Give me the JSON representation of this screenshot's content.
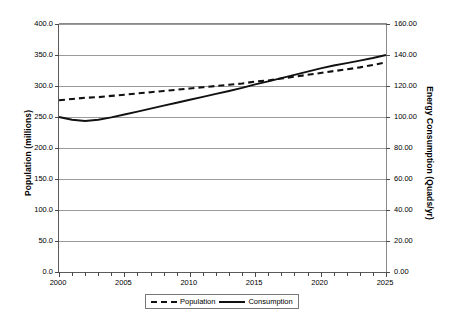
{
  "chart_data": {
    "type": "line",
    "title": "",
    "xlabel": "",
    "ylabel": "Population (millions)",
    "y2label": "Energy Consumption (Quads/yr)",
    "grid": true,
    "legend_position": "bottom",
    "xlim": [
      2000,
      2025
    ],
    "xticks": [
      "2000",
      "2005",
      "2010",
      "2015",
      "2020",
      "2025"
    ],
    "xtick_values": [
      2000,
      2005,
      2010,
      2015,
      2020,
      2025
    ],
    "x_minor_tick_step": 1,
    "ylim": [
      0,
      400
    ],
    "yticks": [
      "0.0",
      "50.0",
      "100.0",
      "150.0",
      "200.0",
      "250.0",
      "300.0",
      "350.0",
      "400.0"
    ],
    "ytick_values": [
      0,
      50,
      100,
      150,
      200,
      250,
      300,
      350,
      400
    ],
    "y2lim": [
      0,
      160
    ],
    "y2ticks": [
      "0.00",
      "20.00",
      "40.00",
      "60.00",
      "80.00",
      "100.00",
      "120.00",
      "140.00",
      "160.00"
    ],
    "y2tick_values": [
      0,
      20,
      40,
      60,
      80,
      100,
      120,
      140,
      160
    ],
    "x": [
      2000,
      2001,
      2002,
      2003,
      2004,
      2005,
      2006,
      2007,
      2008,
      2009,
      2010,
      2011,
      2012,
      2013,
      2014,
      2015,
      2016,
      2017,
      2018,
      2019,
      2020,
      2021,
      2022,
      2023,
      2024,
      2025
    ],
    "series": [
      {
        "name": "Population",
        "axis": "left",
        "style": "dashed",
        "color": "#111111",
        "values": [
          277,
          279,
          281,
          282,
          284,
          286,
          288,
          290,
          292,
          294,
          296,
          298,
          300,
          302,
          304,
          307,
          309,
          312,
          315,
          318,
          321,
          324,
          327,
          330,
          334,
          338
        ]
      },
      {
        "name": "Consumption",
        "axis": "right",
        "style": "solid",
        "color": "#111111",
        "values": [
          100.0,
          98.2,
          97.4,
          98.2,
          99.8,
          101.6,
          103.5,
          105.4,
          107.3,
          109.2,
          111.1,
          113.0,
          114.9,
          116.8,
          118.8,
          121.0,
          123.0,
          125.1,
          127.2,
          129.3,
          131.4,
          133.2,
          134.8,
          136.4,
          138.1,
          140.0
        ]
      }
    ]
  },
  "legend": {
    "items": [
      {
        "label": "Population",
        "style": "dashed"
      },
      {
        "label": "Consumption",
        "style": "solid"
      }
    ]
  }
}
